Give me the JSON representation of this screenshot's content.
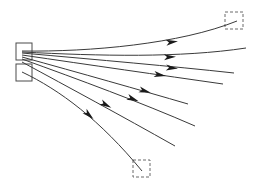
{
  "diagram": {
    "type": "ray-fan",
    "colors": {
      "line": "#3a3a3a",
      "arrow": "#1a1a1a",
      "source_box": "#4a4a4a",
      "target_box": "#6a6a6a",
      "background": "#ffffff"
    },
    "source_boxes": [
      {
        "id": "source-top",
        "x": 16,
        "y": 43,
        "w": 16,
        "h": 17,
        "style": "solid"
      },
      {
        "id": "source-bottom",
        "x": 16,
        "y": 64,
        "w": 16,
        "h": 17,
        "style": "solid"
      }
    ],
    "target_boxes": [
      {
        "id": "target-top-right",
        "x": 225,
        "y": 12,
        "w": 18,
        "h": 17,
        "style": "dashed"
      },
      {
        "id": "target-bottom",
        "x": 133,
        "y": 160,
        "w": 17,
        "h": 17,
        "style": "dashed"
      }
    ],
    "rays": [
      {
        "id": "ray-1",
        "path": "M22,51 C90,52 180,44 237,21",
        "arrow": {
          "x": 172,
          "y": 42,
          "angle": -8
        }
      },
      {
        "id": "ray-2",
        "path": "M22,52 C100,56 180,58 246,48",
        "arrow": {
          "x": 170,
          "y": 57,
          "angle": -2
        }
      },
      {
        "id": "ray-3",
        "path": "M22,53 C100,60 170,66 234,73",
        "arrow": {
          "x": 172,
          "y": 68,
          "angle": 5
        }
      },
      {
        "id": "ray-4",
        "path": "M22,55 C90,65 160,75 223,84",
        "arrow": {
          "x": 160,
          "y": 75,
          "angle": 9
        }
      },
      {
        "id": "ray-5",
        "path": "M22,57 C80,73 140,90 188,104",
        "arrow": {
          "x": 145,
          "y": 91,
          "angle": 16
        }
      },
      {
        "id": "ray-6",
        "path": "M22,59 C80,80 140,102 195,126",
        "arrow": {
          "x": 133,
          "y": 99,
          "angle": 21
        }
      },
      {
        "id": "ray-7",
        "path": "M22,62 C70,88 120,115 175,146",
        "arrow": {
          "x": 106,
          "y": 105,
          "angle": 28
        }
      },
      {
        "id": "ray-8",
        "path": "M22,72 C60,90 100,120 142,171",
        "arrow": {
          "x": 89,
          "y": 115,
          "angle": 42
        }
      }
    ]
  }
}
